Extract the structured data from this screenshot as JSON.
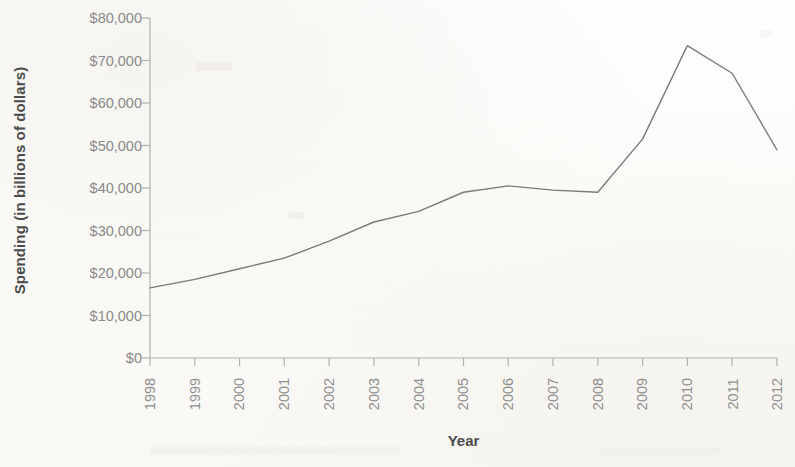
{
  "chart_data": {
    "type": "line",
    "title": "",
    "xlabel": "Year",
    "ylabel": "Spending (in billions of dollars)",
    "categories": [
      "1998",
      "1999",
      "2000",
      "2001",
      "2002",
      "2003",
      "2004",
      "2005",
      "2006",
      "2007",
      "2008",
      "2009",
      "2010",
      "2011",
      "2012"
    ],
    "x": [
      1998,
      1999,
      2000,
      2001,
      2002,
      2003,
      2004,
      2005,
      2006,
      2007,
      2008,
      2009,
      2010,
      2011,
      2012
    ],
    "values": [
      16500,
      18500,
      21000,
      23500,
      27500,
      32000,
      34500,
      39000,
      40500,
      39500,
      39000,
      51500,
      73500,
      67000,
      49000
    ],
    "series": [
      {
        "name": "Spending",
        "values": [
          16500,
          18500,
          21000,
          23500,
          27500,
          32000,
          34500,
          39000,
          40500,
          39500,
          39000,
          51500,
          73500,
          67000,
          49000
        ],
        "color": "#7a7a7a"
      }
    ],
    "ylim": [
      0,
      80000
    ],
    "ytick_values": [
      0,
      10000,
      20000,
      30000,
      40000,
      50000,
      60000,
      70000,
      80000
    ],
    "ytick_labels": [
      "$0",
      "$10,000",
      "$20,000",
      "$30,000",
      "$40,000",
      "$50,000",
      "$60,000",
      "$70,000",
      "$80,000"
    ],
    "grid": false,
    "legend": "none",
    "line_color": "#7a7a7a",
    "axis_color": "#a8a8a8",
    "label_color": "#8a8a8a",
    "title_color": "#4a4a4a",
    "background": "#fdfdfb"
  }
}
